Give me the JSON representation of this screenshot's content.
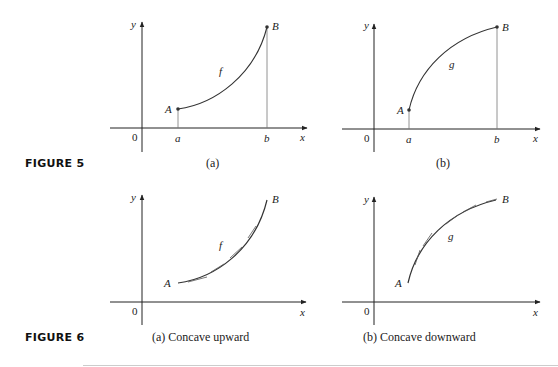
{
  "figures": [
    {
      "label": "FIGURE 5",
      "panels": [
        {
          "caption": "(a)",
          "curve_label": "f",
          "point_a": "A",
          "point_b": "B",
          "tick_a": "a",
          "tick_b": "b",
          "origin": "0",
          "x_axis": "x",
          "y_axis": "y"
        },
        {
          "caption": "(b)",
          "curve_label": "g",
          "point_a": "A",
          "point_b": "B",
          "tick_a": "a",
          "tick_b": "b",
          "origin": "0",
          "x_axis": "x",
          "y_axis": "y"
        }
      ]
    },
    {
      "label": "FIGURE 6",
      "panels": [
        {
          "caption": "(a) Concave upward",
          "curve_label": "f",
          "point_a": "A",
          "point_b": "B",
          "origin": "0",
          "x_axis": "x",
          "y_axis": "y"
        },
        {
          "caption": "(b) Concave downward",
          "curve_label": "g",
          "point_a": "A",
          "point_b": "B",
          "origin": "0",
          "x_axis": "x",
          "y_axis": "y"
        }
      ]
    }
  ],
  "colors": {
    "ink": "#222222",
    "guide": "#777777",
    "rule": "#cccccc"
  }
}
